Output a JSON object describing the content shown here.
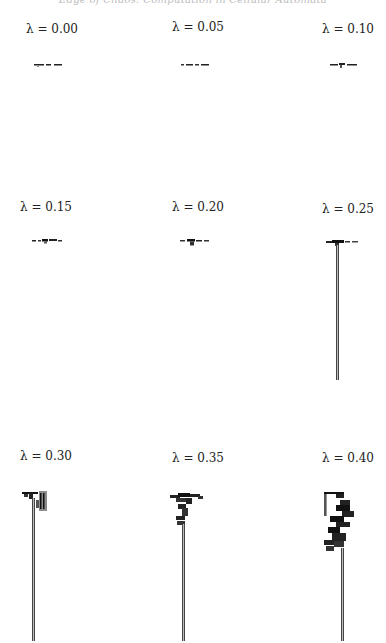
{
  "page": {
    "running_head": "Edge of Chaos: Computation in Cellular Automata",
    "figure": {
      "panels": [
        {
          "label": "λ = 0.00",
          "lambda": 0.0,
          "pattern": "dies quickly",
          "stem_length": 0
        },
        {
          "label": "λ = 0.05",
          "lambda": 0.05,
          "pattern": "dies quickly",
          "stem_length": 0
        },
        {
          "label": "λ = 0.10",
          "lambda": 0.1,
          "pattern": "dies quickly",
          "stem_length": 0
        },
        {
          "label": "λ = 0.15",
          "lambda": 0.15,
          "pattern": "short transient",
          "stem_length": 0
        },
        {
          "label": "λ = 0.20",
          "lambda": 0.2,
          "pattern": "short transient",
          "stem_length": 0
        },
        {
          "label": "λ = 0.25",
          "lambda": 0.25,
          "pattern": "periodic stem",
          "stem_length": 135
        },
        {
          "label": "λ = 0.30",
          "lambda": 0.3,
          "pattern": "periodic stem with side structure",
          "stem_length": 140
        },
        {
          "label": "λ = 0.35",
          "lambda": 0.35,
          "pattern": "branching transient then stem",
          "stem_length": 110
        },
        {
          "label": "λ = 0.40",
          "lambda": 0.4,
          "pattern": "long chaotic transient then stem",
          "stem_length": 75
        }
      ]
    }
  }
}
